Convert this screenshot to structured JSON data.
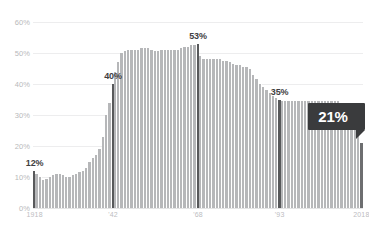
{
  "chart_data": {
    "type": "bar",
    "title": "",
    "subtitle": "",
    "xlabel": "",
    "ylabel": "",
    "ylim": [
      0,
      60
    ],
    "grid": true,
    "legend": false,
    "yticks": [
      "0%",
      "10%",
      "20%",
      "30%",
      "40%",
      "50%",
      "60%"
    ],
    "ytick_values": [
      0,
      10,
      20,
      30,
      40,
      50,
      60
    ],
    "xticks": [
      "1918",
      "'42",
      "'68",
      "'93",
      "2018"
    ],
    "xtick_years": [
      1918,
      1942,
      1968,
      1993,
      2018
    ],
    "categories": [
      1918,
      1919,
      1920,
      1921,
      1922,
      1923,
      1924,
      1925,
      1926,
      1927,
      1928,
      1929,
      1930,
      1931,
      1932,
      1933,
      1934,
      1935,
      1936,
      1937,
      1938,
      1939,
      1940,
      1941,
      1942,
      1943,
      1944,
      1945,
      1946,
      1947,
      1948,
      1949,
      1950,
      1951,
      1952,
      1953,
      1954,
      1955,
      1956,
      1957,
      1958,
      1959,
      1960,
      1961,
      1962,
      1963,
      1964,
      1965,
      1966,
      1967,
      1968,
      1969,
      1970,
      1971,
      1972,
      1973,
      1974,
      1975,
      1976,
      1977,
      1978,
      1979,
      1980,
      1981,
      1982,
      1983,
      1984,
      1985,
      1986,
      1987,
      1988,
      1989,
      1990,
      1991,
      1992,
      1993,
      1994,
      1995,
      1996,
      1997,
      1998,
      1999,
      2000,
      2001,
      2002,
      2003,
      2004,
      2005,
      2006,
      2007,
      2008,
      2009,
      2010,
      2011,
      2012,
      2013,
      2014,
      2015,
      2016,
      2017,
      2018
    ],
    "values": [
      12,
      11,
      10,
      9,
      9.5,
      10,
      10.5,
      11,
      11,
      10.5,
      10,
      10,
      10.5,
      11,
      11.5,
      12,
      13,
      15,
      16,
      17,
      19,
      23,
      30,
      34,
      40,
      44,
      47,
      50,
      50.5,
      51,
      51,
      51,
      51,
      51.5,
      51.5,
      51.5,
      51,
      50.5,
      50.5,
      51,
      51,
      51,
      51,
      51,
      51,
      51.5,
      52,
      52,
      52.5,
      52.5,
      53,
      49,
      48,
      48,
      48,
      48,
      48,
      48,
      47.5,
      47.5,
      47,
      46.5,
      46,
      46,
      45.5,
      45.5,
      45,
      43,
      41.5,
      40,
      39,
      38,
      37,
      36,
      35.5,
      35,
      34.5,
      34.5,
      34.5,
      34.5,
      34.5,
      34.5,
      34.5,
      34.5,
      34.5,
      34.5,
      34.5,
      34.5,
      34.5,
      34.5,
      34.5,
      34.5,
      34.5,
      34.5,
      34,
      34,
      33.5,
      33.5,
      33,
      32,
      21
    ],
    "marker_indices": [
      0,
      24,
      50,
      75
    ],
    "final_index": 100,
    "annotations": [
      {
        "label": "12%",
        "year": 1918,
        "value": 12
      },
      {
        "label": "40%",
        "year": 1942,
        "value": 40
      },
      {
        "label": "53%",
        "year": 1968,
        "value": 53
      },
      {
        "label": "35%",
        "year": 1993,
        "value": 35
      }
    ],
    "callout": {
      "label": "21%",
      "year": 2018,
      "value": 21
    },
    "colors": {
      "bar": "#b6b7b9",
      "marker_bar": "#58595b",
      "final_bar": "#6d6e70",
      "gridline": "#ededee",
      "tick_text": "#bcbdbf",
      "annotation_text": "#3f4042",
      "callout_background": "#3a3b3d",
      "callout_text": "#ffffff",
      "page_background": "#ffffff"
    }
  }
}
